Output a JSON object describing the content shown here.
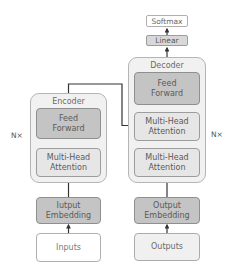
{
  "diagram": {
    "type": "transformer-architecture",
    "encoder": {
      "title": "Encoder",
      "repeat_label": "N×",
      "layers": [
        {
          "label": "Feed\nForward",
          "line1": "Feed",
          "line2": "Forward"
        },
        {
          "label": "Multi-Head\nAttention",
          "line1": "Multi-Head",
          "line2": "Attention"
        }
      ],
      "embedding": {
        "line1": "Iutput",
        "line2": "Embedding"
      },
      "input": {
        "label": "Inputs"
      }
    },
    "decoder": {
      "title": "Decoder",
      "repeat_label": "N×",
      "layers": [
        {
          "line1": "Feed",
          "line2": "Forward"
        },
        {
          "line1": "Multi-Head",
          "line2": "Attention"
        },
        {
          "line1": "Multi-Head",
          "line2": "Attention"
        }
      ],
      "embedding": {
        "line1": "Output",
        "line2": "Embedding"
      },
      "input": {
        "label": "Outputs"
      }
    },
    "head": {
      "linear": "Linear",
      "softmax": "Softmax"
    },
    "edges": [
      [
        "Inputs",
        "Iutput Embedding"
      ],
      [
        "Iutput Embedding",
        "Encoder Multi-Head Attention"
      ],
      [
        "Encoder Multi-Head Attention",
        "Encoder Feed Forward"
      ],
      [
        "Encoder",
        "Decoder Multi-Head Attention (cross)"
      ],
      [
        "Outputs",
        "Output Embedding"
      ],
      [
        "Output Embedding",
        "Decoder Multi-Head Attention (self)"
      ],
      [
        "Decoder Multi-Head Attention (self)",
        "Decoder Multi-Head Attention (cross)"
      ],
      [
        "Decoder Multi-Head Attention (cross)",
        "Decoder Feed Forward"
      ],
      [
        "Decoder",
        "Linear"
      ],
      [
        "Linear",
        "Softmax"
      ]
    ],
    "colors": {
      "container": "#f1f1f1",
      "feed_forward": "#c4c4c4",
      "attention": "#e6e6e6",
      "embedding": "#c4c4c4",
      "line": "#333333"
    }
  }
}
